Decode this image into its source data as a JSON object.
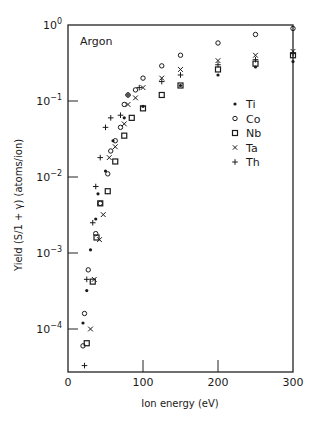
{
  "chart_data": {
    "type": "scatter",
    "title": "Argon",
    "xlabel": "Ion energy (eV)",
    "ylabel": "Yield (S/1 + γ) (atoms/ion)",
    "xscale": "linear",
    "yscale": "log",
    "xlim": [
      0,
      300
    ],
    "ylim": [
      3e-05,
      1
    ],
    "xticks": [
      0,
      100,
      200,
      300
    ],
    "xtick_labels": [
      "0",
      "100",
      "200",
      "300"
    ],
    "yticks": [
      1,
      0.1,
      0.01,
      0.001,
      0.0001
    ],
    "ytick_labels": [
      {
        "base": "10",
        "exp": "0"
      },
      {
        "base": "10",
        "exp": "−1"
      },
      {
        "base": "10",
        "exp": "−2"
      },
      {
        "base": "10",
        "exp": "−3"
      },
      {
        "base": "10",
        "exp": "−4"
      }
    ],
    "grid": false,
    "legend_position": "right-middle inside",
    "series": [
      {
        "name": "Ti",
        "marker": "filled-dot",
        "x": [
          20,
          25,
          30,
          37,
          40,
          50,
          60,
          75,
          100,
          150,
          200,
          250,
          300
        ],
        "y": [
          0.00012,
          0.00032,
          0.0011,
          0.0028,
          0.006,
          0.012,
          0.03,
          0.06,
          0.085,
          0.16,
          0.22,
          0.28,
          0.33
        ]
      },
      {
        "name": "Co",
        "marker": "open-circle",
        "x": [
          20,
          22,
          27,
          37,
          43,
          53,
          57,
          63,
          70,
          75,
          80,
          90,
          100,
          125,
          150,
          200,
          250,
          300
        ],
        "y": [
          6e-05,
          0.00016,
          0.0006,
          0.0018,
          0.0045,
          0.011,
          0.022,
          0.03,
          0.045,
          0.09,
          0.12,
          0.14,
          0.2,
          0.29,
          0.4,
          0.58,
          0.75,
          0.9
        ]
      },
      {
        "name": "Nb",
        "marker": "open-square",
        "x": [
          25,
          33,
          38,
          43,
          53,
          63,
          75,
          85,
          100,
          125,
          150,
          200,
          250,
          300
        ],
        "y": [
          6.5e-05,
          0.00042,
          0.0016,
          0.0045,
          0.0065,
          0.016,
          0.035,
          0.06,
          0.08,
          0.12,
          0.16,
          0.26,
          0.31,
          0.4
        ]
      },
      {
        "name": "Ta",
        "marker": "x",
        "x": [
          30,
          35,
          42,
          47,
          55,
          63,
          75,
          80,
          90,
          100,
          125,
          150,
          200,
          250,
          300
        ],
        "y": [
          0.0001,
          0.00045,
          0.0015,
          0.0032,
          0.018,
          0.025,
          0.05,
          0.09,
          0.11,
          0.15,
          0.2,
          0.26,
          0.34,
          0.4,
          0.45
        ]
      },
      {
        "name": "Th",
        "marker": "plus",
        "x": [
          22,
          25,
          33,
          37,
          43,
          50,
          57,
          70,
          80,
          95,
          125,
          150,
          200,
          250,
          300
        ],
        "y": [
          3.3e-05,
          0.00045,
          0.0025,
          0.0075,
          0.018,
          0.045,
          0.06,
          0.065,
          0.12,
          0.15,
          0.18,
          0.22,
          0.3,
          0.35,
          0.42
        ]
      }
    ]
  },
  "legend": {
    "items": [
      {
        "label": "Ti",
        "marker": "filled-dot"
      },
      {
        "label": "Co",
        "marker": "open-circle"
      },
      {
        "label": "Nb",
        "marker": "open-square"
      },
      {
        "label": "Ta",
        "marker": "x"
      },
      {
        "label": "Th",
        "marker": "plus"
      }
    ]
  },
  "annotation": "Argon"
}
